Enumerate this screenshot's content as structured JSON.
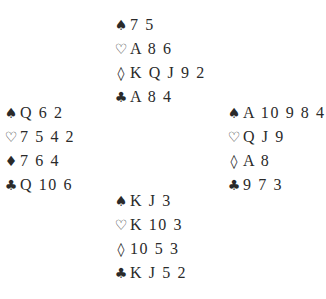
{
  "deal": {
    "north": {
      "spades": "7 5",
      "hearts": "A 8 6",
      "diamonds": "K Q J 9 2",
      "clubs": "A 8 4"
    },
    "west": {
      "spades": "Q 6 2",
      "hearts": "7 5 4 2",
      "diamonds": "7 6 4",
      "clubs": "Q 10 6"
    },
    "east": {
      "spades": "A 10 9 8 4",
      "hearts": "Q J 9",
      "diamonds": "A 8",
      "clubs": "9 7 3"
    },
    "south": {
      "spades": "K J 3",
      "hearts": "K 10 3",
      "diamonds": "10 5 3",
      "clubs": "K J 5 2"
    }
  },
  "symbols": {
    "spade": "♠",
    "heart": "♡",
    "diamond_outline": "◊",
    "diamond_filled": "♦",
    "club": "♣"
  }
}
